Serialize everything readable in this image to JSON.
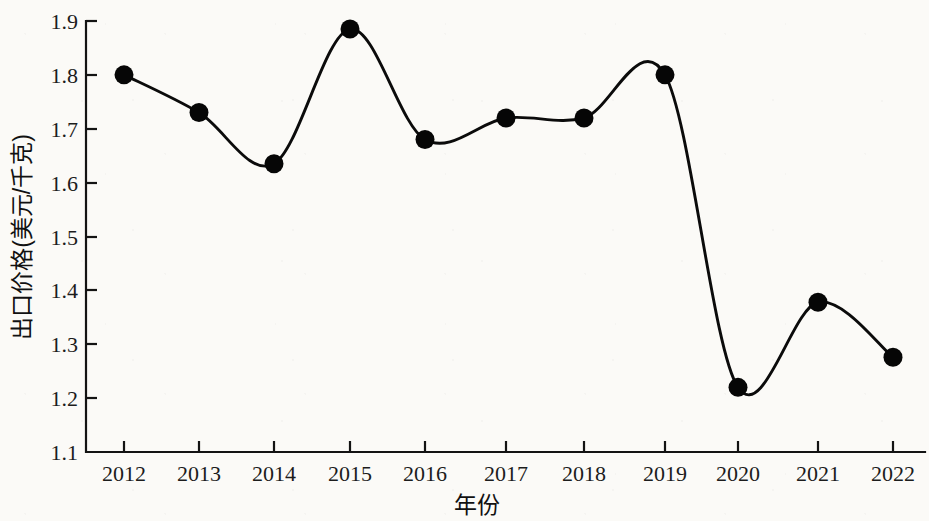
{
  "chart_data": {
    "type": "line",
    "title": "",
    "subtitle": "",
    "xlabel": "年份",
    "ylabel": "出口价格(美元/千克)",
    "categories": [
      "2012",
      "2013",
      "2014",
      "2015",
      "2016",
      "2017",
      "2018",
      "2019",
      "2020",
      "2021",
      "2022"
    ],
    "x": [
      2012,
      2013,
      2014,
      2015,
      2016,
      2017,
      2018,
      2019,
      2020,
      2021,
      2022
    ],
    "values": [
      1.8,
      1.73,
      1.635,
      1.885,
      1.68,
      1.72,
      1.72,
      1.8,
      1.22,
      1.378,
      1.276
    ],
    "series": [
      {
        "name": "出口价格",
        "values": [
          1.8,
          1.73,
          1.635,
          1.885,
          1.68,
          1.72,
          1.72,
          1.8,
          1.22,
          1.378,
          1.276
        ]
      }
    ],
    "ylim": [
      1.1,
      1.9
    ],
    "yticks": [
      "1.1",
      "1.2",
      "1.3",
      "1.4",
      "1.5",
      "1.6",
      "1.7",
      "1.8",
      "1.9"
    ],
    "ytick_values": [
      1.1,
      1.2,
      1.3,
      1.4,
      1.5,
      1.6,
      1.7,
      1.8,
      1.9
    ],
    "xticks": [
      "2012",
      "2013",
      "2014",
      "2015",
      "2016",
      "2017",
      "2018",
      "2019",
      "2020",
      "2021",
      "2022"
    ],
    "grid": false,
    "legend": false,
    "legend_position": "none",
    "marker": "circle",
    "line_color": "#0b0b0b",
    "marker_color": "#060606",
    "interpolation": "smooth",
    "annotations": []
  },
  "axis": {
    "y_title": "出口价格(美元/千克)",
    "x_title": "年份",
    "y_tick_labels": [
      "1.9",
      "1.8",
      "1.7",
      "1.6",
      "1.5",
      "1.4",
      "1.3",
      "1.2",
      "1.1"
    ],
    "x_tick_labels": [
      "2012",
      "2013",
      "2014",
      "2015",
      "2016",
      "2017",
      "2018",
      "2019",
      "2020",
      "2021",
      "2022"
    ]
  },
  "colors": {
    "background": "#fbfaf7",
    "axis": "#131313",
    "line": "#0b0b0b",
    "marker": "#060606",
    "text": "#1a1a1a"
  }
}
